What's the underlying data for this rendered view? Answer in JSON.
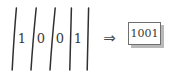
{
  "figure": {
    "background_color": "#ffffff",
    "ink_color": "#3a3a3a",
    "bar_color": "#2f2f2f",
    "box_border_color": "#6f6f6f",
    "box_shadow_color": "#b9b9b9"
  },
  "input_sequence": {
    "label": "bit-sequence-with-separators",
    "separator_glyph": "|",
    "separator_count": 5,
    "digits": [
      {
        "value": "1"
      },
      {
        "value": "0"
      },
      {
        "value": "0"
      },
      {
        "value": "1"
      }
    ]
  },
  "operator": {
    "glyph": "⇒",
    "name": "implies"
  },
  "result": {
    "value": "1001"
  }
}
